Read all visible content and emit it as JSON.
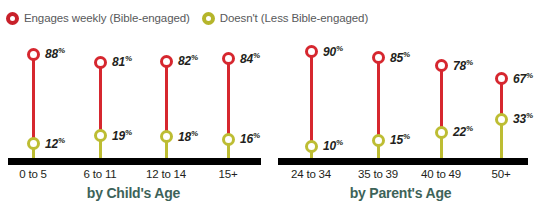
{
  "legend": {
    "items": [
      {
        "icon": "ring-icon",
        "color": "#c8202a",
        "label": "Engages weekly (Bible-engaged)"
      },
      {
        "icon": "ring-icon",
        "color": "#b5b52b",
        "label": "Doesn't (Less Bible-engaged)"
      }
    ]
  },
  "colors": {
    "red": "#d6272f",
    "olive": "#bdbd33",
    "axis": "#000000",
    "title": "#3d6359",
    "legend_text": "#58595b",
    "value_text": "#231f20"
  },
  "chart_data": [
    {
      "type": "line",
      "title": "by Child's Age",
      "xlabel": "",
      "ylabel": "",
      "ylim": [
        0,
        100
      ],
      "grid": false,
      "legend_position": "top-left",
      "categories": [
        "0 to 5",
        "6 to 11",
        "12 to 14",
        "15+"
      ],
      "series": [
        {
          "name": "Engages weekly (Bible-engaged)",
          "color": "#d6272f",
          "values": [
            88,
            81,
            82,
            84
          ],
          "labels": [
            "88%",
            "81%",
            "82%",
            "84%"
          ]
        },
        {
          "name": "Doesn't (Less Bible-engaged)",
          "color": "#bdbd33",
          "values": [
            12,
            19,
            18,
            16
          ],
          "labels": [
            "12%",
            "19%",
            "18%",
            "16%"
          ]
        }
      ]
    },
    {
      "type": "line",
      "title": "by Parent's Age",
      "xlabel": "",
      "ylabel": "",
      "ylim": [
        0,
        100
      ],
      "grid": false,
      "legend_position": "top-left",
      "categories": [
        "24 to 34",
        "35 to 39",
        "40 to 49",
        "50+"
      ],
      "series": [
        {
          "name": "Engages weekly (Bible-engaged)",
          "color": "#d6272f",
          "values": [
            90,
            85,
            78,
            67
          ],
          "labels": [
            "90%",
            "85%",
            "78%",
            "67%"
          ]
        },
        {
          "name": "Doesn't (Less Bible-engaged)",
          "color": "#bdbd33",
          "values": [
            10,
            15,
            22,
            33
          ],
          "labels": [
            "10%",
            "15%",
            "22%",
            "33%"
          ]
        }
      ]
    }
  ],
  "percent_symbol": "%"
}
